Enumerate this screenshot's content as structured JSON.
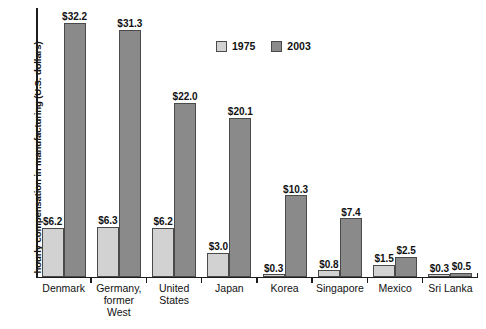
{
  "chart_data": {
    "type": "bar",
    "title": "",
    "xlabel": "",
    "ylabel": "hourly compensation in manufacturing (U.S. dollars)",
    "ylim": [
      0,
      34
    ],
    "grid": false,
    "legend_position": "top-center",
    "categories": [
      "Denmark",
      "Germany,\nformer\nWest",
      "United\nStates",
      "Japan",
      "Korea",
      "Singapore",
      "Mexico",
      "Sri Lanka"
    ],
    "series": [
      {
        "name": "1975",
        "color": "#d2d2d2",
        "values": [
          6.2,
          6.3,
          6.2,
          3.0,
          0.3,
          0.8,
          1.5,
          0.3
        ],
        "labels": [
          "$6.2",
          "$6.3",
          "$6.2",
          "$3.0",
          "$0.3",
          "$0.8",
          "$1.5",
          "$0.3"
        ]
      },
      {
        "name": "2003",
        "color": "#8a8a8a",
        "values": [
          32.2,
          31.3,
          22.0,
          20.1,
          10.3,
          7.4,
          2.5,
          0.5
        ],
        "labels": [
          "$32.2",
          "$31.3",
          "$22.0",
          "$20.1",
          "$10.3",
          "$7.4",
          "$2.5",
          "$0.5"
        ]
      }
    ]
  },
  "legend": {
    "items": [
      {
        "label": "1975"
      },
      {
        "label": "2003"
      }
    ]
  }
}
